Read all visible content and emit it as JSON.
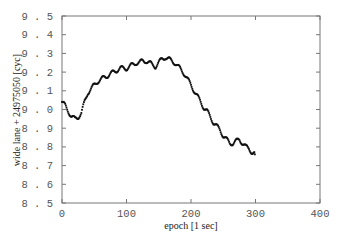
{
  "chart_data": {
    "type": "scatter",
    "title": "",
    "xlabel": "epoch  [1 sec]",
    "ylabel": "wide lane + 24975050  [cyc]",
    "xlim": [
      0,
      400
    ],
    "ylim": [
      8.5,
      9.5
    ],
    "x_ticks": [
      0,
      100,
      200,
      300,
      400
    ],
    "x_tick_labels": [
      "0",
      "100",
      "200",
      "300",
      "400"
    ],
    "y_ticks": [
      8.5,
      8.6,
      8.7,
      8.8,
      8.9,
      9.0,
      9.1,
      9.2,
      9.3,
      9.4,
      9.5
    ],
    "y_tick_labels": [
      "8.5",
      "8.6",
      "8.7",
      "8.8",
      "8.9",
      "9.0",
      "9.1",
      "9.2",
      "9.3",
      "9.4",
      "9.5"
    ],
    "grid": false,
    "legend": null,
    "series": [
      {
        "name": "wide lane",
        "marker_color": "#111111",
        "x": [
          0,
          5,
          10,
          15,
          20,
          25,
          30,
          35,
          40,
          45,
          50,
          55,
          60,
          65,
          70,
          75,
          80,
          85,
          90,
          95,
          100,
          105,
          110,
          115,
          120,
          125,
          130,
          135,
          140,
          145,
          150,
          155,
          160,
          165,
          170,
          175,
          180,
          185,
          190,
          195,
          200,
          205,
          210,
          215,
          220,
          225,
          230,
          235,
          240,
          245,
          250,
          255,
          260,
          265,
          270,
          275,
          280,
          285,
          290,
          295,
          299
        ],
        "y": [
          9.04,
          9.02,
          8.99,
          8.96,
          8.95,
          8.96,
          8.98,
          9.04,
          9.09,
          9.11,
          9.13,
          9.15,
          9.16,
          9.17,
          9.18,
          9.19,
          9.2,
          9.21,
          9.22,
          9.22,
          9.22,
          9.23,
          9.24,
          9.25,
          9.25,
          9.26,
          9.26,
          9.25,
          9.24,
          9.23,
          9.25,
          9.27,
          9.28,
          9.27,
          9.26,
          9.25,
          9.23,
          9.21,
          9.19,
          9.16,
          9.13,
          9.1,
          9.07,
          9.04,
          9.01,
          8.99,
          8.96,
          8.93,
          8.91,
          8.89,
          8.86,
          8.84,
          8.82,
          8.82,
          8.83,
          8.84,
          8.82,
          8.8,
          8.79,
          8.77,
          8.76
        ]
      }
    ]
  }
}
